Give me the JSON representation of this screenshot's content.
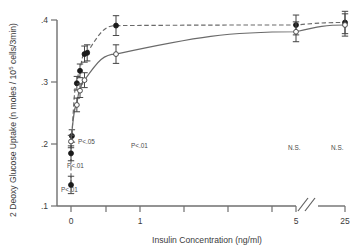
{
  "chart_data": {
    "type": "scatter",
    "title": "",
    "xlabel": "Insulin Concentration  (ng/ml)",
    "ylabel": "2 Deoxy Glucose Uptake (n moles / 10",
    "ylabel_sup": "5",
    "ylabel_tail": " cells/3min)",
    "y_ticks": [
      ".1",
      ".2",
      ".3",
      ".4"
    ],
    "y_tick_values": [
      0.1,
      0.2,
      0.3,
      0.4
    ],
    "ylim": [
      0.085,
      0.415
    ],
    "x_ticks_labeled": [
      "0",
      "1",
      "5",
      "25"
    ],
    "x_tick_values": [
      0,
      1,
      5,
      25
    ],
    "xlim": [
      0,
      25
    ],
    "axis_break": true,
    "grid": false,
    "legend": "none",
    "series": [
      {
        "name": "filled-circles-dashed",
        "marker": "filled circle",
        "line": "dashed",
        "points": [
          {
            "x": 0.0,
            "y": 0.134,
            "err": 0.014
          },
          {
            "x": 0.0,
            "y": 0.185,
            "err": 0.012
          },
          {
            "x": 0.02,
            "y": 0.213,
            "err": 0.01
          },
          {
            "x": 0.13,
            "y": 0.298,
            "err": 0.011
          },
          {
            "x": 0.2,
            "y": 0.318,
            "err": 0.011
          },
          {
            "x": 0.3,
            "y": 0.345,
            "err": 0.013
          },
          {
            "x": 0.36,
            "y": 0.347,
            "err": 0.013
          },
          {
            "x": 1.0,
            "y": 0.391,
            "err": 0.016
          },
          {
            "x": 5.0,
            "y": 0.392,
            "err": 0.016
          },
          {
            "x": 25.0,
            "y": 0.396,
            "err": 0.018
          }
        ]
      },
      {
        "name": "open-circles-solid",
        "marker": "open circle",
        "line": "solid",
        "points": [
          {
            "x": 0.0,
            "y": 0.204,
            "err": 0.01
          },
          {
            "x": 0.13,
            "y": 0.263,
            "err": 0.011
          },
          {
            "x": 0.2,
            "y": 0.286,
            "err": 0.011
          },
          {
            "x": 0.3,
            "y": 0.303,
            "err": 0.012
          },
          {
            "x": 1.0,
            "y": 0.345,
            "err": 0.015
          },
          {
            "x": 5.0,
            "y": 0.381,
            "err": 0.016
          },
          {
            "x": 25.0,
            "y": 0.392,
            "err": 0.018
          }
        ]
      }
    ],
    "annotations": [
      {
        "text": "P<.05",
        "x_px": 78,
        "y_px": 144
      },
      {
        "text": "P<.01",
        "x_px": 67,
        "y_px": 168
      },
      {
        "text": "P<.01",
        "x_px": 61,
        "y_px": 192
      },
      {
        "text": "P<.01",
        "x_px": 131,
        "y_px": 148
      },
      {
        "text": "N.S.",
        "x_px": 288,
        "y_px": 150
      },
      {
        "text": "N.S.",
        "x_px": 331,
        "y_px": 150
      }
    ]
  }
}
